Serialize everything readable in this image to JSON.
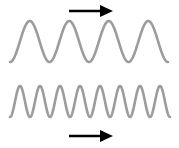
{
  "figure": {
    "background_color": "#ffffff",
    "width": 179,
    "height": 148
  },
  "chart_data": {
    "type": "line",
    "title": "",
    "xlabel": "",
    "ylabel": "",
    "grid": false,
    "legend": "none",
    "series": [
      {
        "name": "low-frequency-wave",
        "waveform": "sine",
        "cycles": 4,
        "period_px": 39.5,
        "amplitude_px": 20.5,
        "baseline_y_px": 41.5,
        "peak_y_px": 21,
        "trough_y_px": 62,
        "x_start_px": 10,
        "x_end_px": 168,
        "color": "#9c9c9c",
        "stroke_width_px": 2.6,
        "phase": "starts at trough"
      },
      {
        "name": "high-frequency-wave",
        "waveform": "sine",
        "cycles": 8,
        "period_px": 20,
        "amplitude_px": 15.5,
        "baseline_y_px": 101.5,
        "peak_y_px": 86,
        "trough_y_px": 117,
        "x_start_px": 10,
        "x_end_px": 170,
        "color": "#9c9c9c",
        "stroke_width_px": 2.6,
        "phase": "starts at trough"
      }
    ]
  },
  "annotations": {
    "top_arrow": {
      "name": "direction-arrow-top",
      "direction": "right",
      "color": "#000000",
      "x_start_px": 69,
      "x_tip_px": 113,
      "y_px": 11,
      "shaft_width_px": 2.4,
      "head_length_px": 13,
      "head_half_height_px": 6
    },
    "bottom_arrow": {
      "name": "direction-arrow-bottom",
      "direction": "right",
      "color": "#000000",
      "x_start_px": 69,
      "x_tip_px": 113,
      "y_px": 136,
      "shaft_width_px": 2.4,
      "head_length_px": 13,
      "head_half_height_px": 6
    }
  }
}
